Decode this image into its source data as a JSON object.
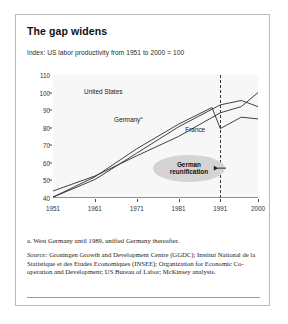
{
  "exhibit": {
    "title": "The gap widens",
    "subtitle": "Index: US labor productivity from 1951 to 2000 = 100",
    "footnote": "a. West Germany until 1989, unified Germany thereafter.",
    "source_label": "Source:",
    "source_text": " Groningen Growth and Development Centre (GGDC); Institut National de la Statistique et des Etudes Economiques (INSEE); Organization for Economic Co-operation and Development; US Bureau of Labor; McKinsey analysis."
  },
  "annotations": {
    "callout_line1": "German",
    "callout_line2": "reunification",
    "reunification_year": 1991,
    "arrow_icon": "arrow-right-icon"
  },
  "colors": {
    "card_border": "#b9b9b9",
    "plot_background": "#f7f7f7",
    "line": "#2c2c2c",
    "callout_fill": "#d4d4d4",
    "axis": "#8f8f8f"
  },
  "chart_data": {
    "type": "line",
    "title": "The gap widens",
    "subtitle": "Index: US labor productivity from 1951 to 2000 = 100",
    "xlabel": "",
    "ylabel": "",
    "xlim": [
      1951,
      2000
    ],
    "ylim": [
      40,
      110
    ],
    "yticks": [
      40,
      50,
      60,
      70,
      80,
      90,
      100,
      110
    ],
    "xticks": [
      1951,
      1961,
      1971,
      1981,
      1991,
      2000
    ],
    "grid": false,
    "legend": "inline-labels",
    "series": [
      {
        "name": "United States",
        "label_position": "upper-left",
        "x": [
          1951,
          1961,
          1971,
          1981,
          1991,
          1996,
          2000
        ],
        "values": [
          44.0,
          52.5,
          64.0,
          75.0,
          88.5,
          92.0,
          100.0
        ]
      },
      {
        "name": "Germany",
        "footnote_marker": "a",
        "label_position": "mid-left",
        "x": [
          1951,
          1961,
          1971,
          1981,
          1989,
          1991,
          1996,
          2000
        ],
        "values": [
          40.5,
          52.0,
          68.0,
          82.0,
          91.5,
          79.5,
          86.0,
          85.0
        ]
      },
      {
        "name": "France",
        "label_position": "mid-right",
        "x": [
          1951,
          1961,
          1971,
          1981,
          1991,
          1996,
          2000
        ],
        "values": [
          40.5,
          50.5,
          65.5,
          80.5,
          93.0,
          95.5,
          92.0
        ]
      }
    ]
  }
}
